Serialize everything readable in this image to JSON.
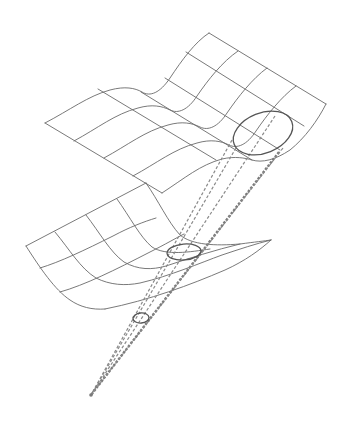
{
  "diagram": {
    "colors": {
      "background": "#ffffff",
      "grid_lines": "#6a6a6a",
      "projection_rays": "#8a8a8a",
      "ellipses": "#555555"
    },
    "upper_surface": {
      "type": "wavy-sheet",
      "corners": {
        "left": [
          45,
          123
        ],
        "top": [
          209,
          33
        ],
        "right": [
          326,
          104
        ],
        "bottom": [
          162,
          193
        ]
      },
      "ruling_lines": 5
    },
    "lower_surface": {
      "type": "curled-sheet",
      "corners": {
        "left": [
          26,
          246
        ],
        "top": [
          146,
          183
        ],
        "tip": [
          271,
          240
        ]
      },
      "ruling_lines": 4
    },
    "ellipses": [
      {
        "name": "upper-footprint",
        "cx": 263,
        "cy": 133,
        "rx": 31,
        "ry": 20,
        "rotate": -22
      },
      {
        "name": "lower-footprint",
        "cx": 184,
        "cy": 252,
        "rx": 17,
        "ry": 8,
        "rotate": -5
      },
      {
        "name": "aperture",
        "cx": 141,
        "cy": 318,
        "rx": 8,
        "ry": 5,
        "rotate": -5
      }
    ],
    "focal_point": [
      91,
      395
    ]
  }
}
